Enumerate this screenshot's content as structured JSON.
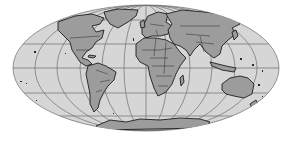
{
  "map": {
    "projection": "Mollweide",
    "colors": {
      "background": "#ffffff",
      "ocean": "#d6d6d6",
      "land": "#9c9c9c",
      "coastline": "#1e1e1e",
      "graticule": "#6e6e6e"
    },
    "continents": [
      "North America",
      "South America",
      "Europe",
      "Africa",
      "Asia",
      "Australia",
      "Antarctica",
      "Greenland"
    ]
  }
}
